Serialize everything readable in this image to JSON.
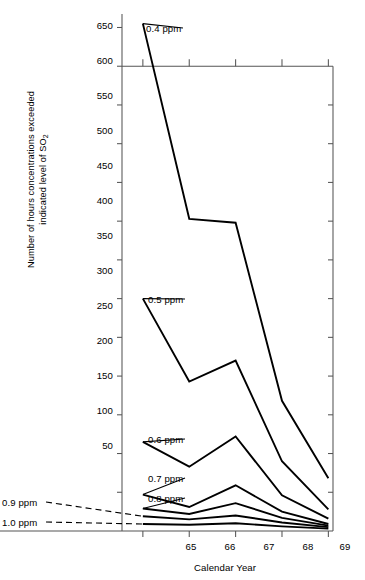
{
  "chart_data": {
    "type": "line",
    "title": "",
    "xlabel": "Calendar Year",
    "ylabel": "Number of hours concentrations exceeded indicated level of SO",
    "ylabel_sub": "2",
    "x": [
      65,
      66,
      67,
      68,
      69
    ],
    "xtick_labels": [
      "65",
      "66",
      "67",
      "68",
      "69"
    ],
    "ytick_labels": [
      "50",
      "100",
      "150",
      "200",
      "250",
      "300",
      "350",
      "400",
      "450",
      "500",
      "550",
      "600",
      "650"
    ],
    "ytick_values": [
      50,
      100,
      150,
      200,
      250,
      300,
      350,
      400,
      450,
      500,
      550,
      600,
      650
    ],
    "ylim": [
      0,
      670
    ],
    "xlim": [
      64.55,
      69.1
    ],
    "grid": false,
    "legend": "inline-labels",
    "series": [
      {
        "name": "0.4 ppm",
        "values": [
          655,
          403,
          398,
          168,
          68
        ]
      },
      {
        "name": "0.5 ppm",
        "values": [
          300,
          193,
          220,
          90,
          28
        ]
      },
      {
        "name": "0.6 ppm",
        "values": [
          115,
          83,
          122,
          46,
          16
        ]
      },
      {
        "name": "0.7 ppm",
        "values": [
          47,
          31,
          59,
          25,
          9
        ]
      },
      {
        "name": "0.8 ppm",
        "values": [
          29,
          22,
          36,
          17,
          7
        ]
      },
      {
        "name": "0.9 ppm",
        "values": [
          19,
          15,
          20,
          11,
          5
        ]
      },
      {
        "name": "1.0 ppm",
        "values": [
          9,
          8,
          10,
          6,
          3
        ]
      }
    ]
  },
  "labels": {
    "ppm_04": "0.4 ppm",
    "ppm_05": "0.5 ppm",
    "ppm_06": "0.6 ppm",
    "ppm_07": "0.7 ppm",
    "ppm_08": "0.8 ppm",
    "ppm_09": "0.9 ppm",
    "ppm_10": "1.0 ppm"
  },
  "axis": {
    "x_title": "Calendar Year",
    "y_title_line1": "Number of hours concentrations exceeded",
    "y_title_line2": "indicated level of SO",
    "y_title_sub": "2"
  },
  "colors": {
    "line": "#000000",
    "axis": "#555555",
    "background": "#ffffff"
  }
}
